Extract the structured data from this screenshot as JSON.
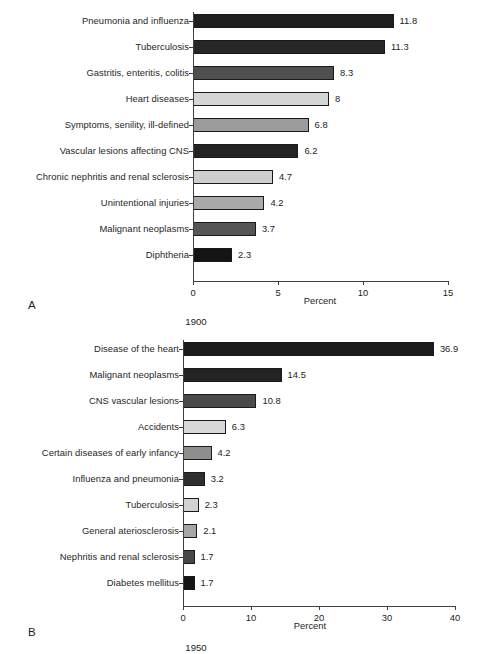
{
  "figure": {
    "panel_a_letter": "A",
    "panel_b_letter": "B",
    "axis_title": "Percent",
    "year_a": "1900",
    "year_b": "1950"
  },
  "chart_data": [
    {
      "type": "bar",
      "orientation": "horizontal",
      "panel": "A",
      "title": "1900",
      "xlabel": "Percent",
      "ylabel": "",
      "xlim": [
        0,
        15
      ],
      "xticks": [
        0,
        5,
        10,
        15
      ],
      "xticklabels": [
        "0",
        "5",
        "10",
        "15"
      ],
      "grid": false,
      "legend": false,
      "categories": [
        "Pneumonia and influenza",
        "Tuberculosis",
        "Gastritis, enteritis, colitis",
        "Heart diseases",
        "Symptoms, senility, ill-defined",
        "Vascular lesions affecting CNS",
        "Chronic nephritis and renal sclerosis",
        "Unintentional injuries",
        "Malignant neoplasms",
        "Diphtheria"
      ],
      "values": [
        11.8,
        11.3,
        8.3,
        8,
        6.8,
        6.2,
        4.7,
        4.2,
        3.7,
        2.3
      ],
      "value_labels": [
        "11.8",
        "11.3",
        "8.3",
        "8",
        "6.8",
        "6.2",
        "4.7",
        "4.2",
        "3.7",
        "2.3"
      ],
      "bar_colors": [
        "#1f1f1f",
        "#262626",
        "#4f4f4f",
        "#d6d6d6",
        "#9b9b9b",
        "#232323",
        "#cfcfcf",
        "#a9a9a9",
        "#565656",
        "#141414"
      ]
    },
    {
      "type": "bar",
      "orientation": "horizontal",
      "panel": "B",
      "title": "1950",
      "xlabel": "Percent",
      "ylabel": "",
      "xlim": [
        0,
        40
      ],
      "xticks": [
        0,
        10,
        20,
        30,
        40
      ],
      "xticklabels": [
        "0",
        "10",
        "20",
        "30",
        "40"
      ],
      "grid": false,
      "legend": false,
      "categories": [
        "Disease of the heart",
        "Malignant neoplasms",
        "CNS vascular lesions",
        "Accidents",
        "Certain diseases of early infancy",
        "Influenza and pneumonia",
        "Tuberculosis",
        "General ateriosclerosis",
        "Nephritis and renal sclerosis",
        "Diabetes mellitus"
      ],
      "values": [
        36.9,
        14.5,
        10.8,
        6.3,
        4.2,
        3.2,
        2.3,
        2.1,
        1.7,
        1.7
      ],
      "value_labels": [
        "36.9",
        "14.5",
        "10.8",
        "6.3",
        "4.2",
        "3.2",
        "2.3",
        "2.1",
        "1.7",
        "1.7"
      ],
      "bar_colors": [
        "#1c1c1c",
        "#232323",
        "#4a4a4a",
        "#d8d8d8",
        "#8e8e8e",
        "#2e2e2e",
        "#d2d2d2",
        "#a6a6a6",
        "#474747",
        "#161616"
      ]
    }
  ]
}
